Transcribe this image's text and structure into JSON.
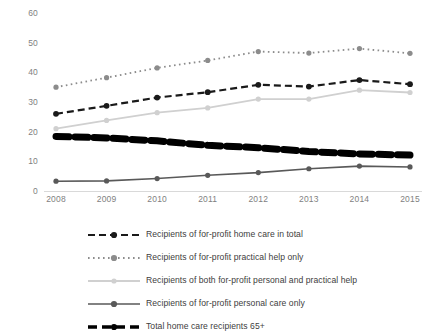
{
  "chart_data": {
    "type": "line",
    "title": "",
    "subtitle": "",
    "xlabel": "",
    "ylabel": "",
    "categories": [
      "2008",
      "2009",
      "2010",
      "2011",
      "2012",
      "2013",
      "2014",
      "2015"
    ],
    "x": [
      2008,
      2009,
      2010,
      2011,
      2012,
      2013,
      2014,
      2015
    ],
    "ylim": [
      0,
      60
    ],
    "yticks": [
      0,
      10,
      20,
      30,
      40,
      50,
      60
    ],
    "ytick_labels": [
      "0",
      "10",
      "20",
      "30",
      "40",
      "50",
      "60"
    ],
    "grid": false,
    "legend_position": "bottom",
    "series": [
      {
        "name": "Recipients of for-profit home care in total",
        "values": [
          26.0,
          28.7,
          31.5,
          33.3,
          35.8,
          35.2,
          37.4,
          36.0
        ],
        "color": "#1a1a1a",
        "style": "dashed",
        "marker": "circle",
        "width": 2.2
      },
      {
        "name": "Recipients of for-profit practical help only",
        "values": [
          35.0,
          38.2,
          41.5,
          44.0,
          47.0,
          46.5,
          48.0,
          46.4
        ],
        "color": "#8c8c8c",
        "style": "dotted",
        "marker": "circle",
        "width": 1.8
      },
      {
        "name": "Recipients of both for-profit personal and practical help",
        "values": [
          21.0,
          23.8,
          26.4,
          28.0,
          31.0,
          31.0,
          34.0,
          33.2
        ],
        "color": "#d0d0d0",
        "style": "solid",
        "marker": "circle",
        "width": 1.8
      },
      {
        "name": "Recipients of for-profit personal care only",
        "values": [
          3.3,
          3.4,
          4.2,
          5.3,
          6.2,
          7.5,
          8.4,
          8.1
        ],
        "color": "#595959",
        "style": "solid",
        "marker": "circle",
        "width": 1.6
      },
      {
        "name": "Total home care recipients 65+",
        "values": [
          18.4,
          17.9,
          16.9,
          15.4,
          14.6,
          13.3,
          12.5,
          12.1
        ],
        "color": "#000000",
        "style": "dashed-thick",
        "marker": "none",
        "width": 7
      }
    ]
  },
  "legend": {
    "items": [
      {
        "label": "Recipients of for-profit home care in total",
        "key": "dashed-marker-black"
      },
      {
        "label": "Recipients of for-profit practical help only",
        "key": "dotted-marker-gray"
      },
      {
        "label": "Recipients of both for-profit personal and practical help",
        "key": "solid-marker-lightgray"
      },
      {
        "label": "Recipients of for-profit personal care only",
        "key": "solid-marker-darkgray"
      },
      {
        "label": "Total home care recipients 65+",
        "key": "thick-dashed-marker-black"
      }
    ]
  },
  "colors": {
    "axis_text": "#7f7f7f",
    "legend_text": "#404040",
    "background": "#ffffff",
    "axis_line": "#d9d9d9"
  }
}
